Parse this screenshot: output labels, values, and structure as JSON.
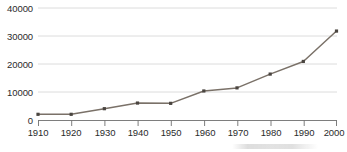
{
  "chart_data": {
    "type": "line",
    "title": "",
    "subtitle": "",
    "xlabel": "",
    "ylabel": "",
    "categories": [
      "1910",
      "1920",
      "1930",
      "1940",
      "1950",
      "1960",
      "1970",
      "1980",
      "1990",
      "2000"
    ],
    "x": [
      1910,
      1920,
      1930,
      1940,
      1950,
      1960,
      1970,
      1980,
      1990,
      2000
    ],
    "values": [
      2200,
      2200,
      4200,
      6200,
      6100,
      10500,
      11600,
      16500,
      21000,
      31800
    ],
    "series": [
      {
        "name": "",
        "values": [
          2200,
          2200,
          4200,
          6200,
          6100,
          10500,
          11600,
          16500,
          21000,
          31800
        ]
      }
    ],
    "ylim": [
      0,
      42000
    ],
    "xlim": [
      1910,
      2000
    ],
    "yticks": [
      0,
      10000,
      20000,
      30000,
      40000
    ],
    "ytick_labels": [
      "0",
      "10000",
      "20000",
      "30000",
      "40000"
    ],
    "xticks": [
      1910,
      1920,
      1930,
      1940,
      1950,
      1960,
      1970,
      1980,
      1990,
      2000
    ],
    "xtick_labels": [
      "1910",
      "1920",
      "1930",
      "1940",
      "1950",
      "1960",
      "1970",
      "1980",
      "1990",
      "2000"
    ],
    "grid": "horizontal",
    "legend": "none",
    "marker": "square",
    "annotations": [],
    "colors": {
      "line": "#7a7168",
      "marker": "#4a4540",
      "gridline": "#d3d3d3",
      "axis": "#6f6f6f",
      "text": "#2b2b2b",
      "background": "#ffffff"
    }
  }
}
